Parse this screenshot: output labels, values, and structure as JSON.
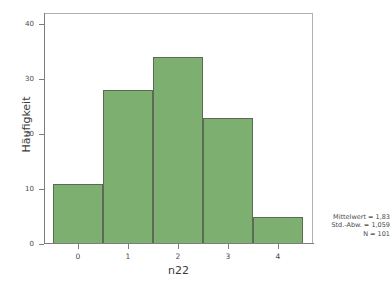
{
  "chart_data": {
    "type": "bar",
    "title": "",
    "subtitle": "",
    "xlabel": "n22",
    "ylabel": "Häufigkeit",
    "categories": [
      "0",
      "1",
      "2",
      "3",
      "4"
    ],
    "values": [
      11,
      28,
      34,
      23,
      5
    ],
    "series": [
      {
        "name": "Häufigkeit",
        "values": [
          11,
          28,
          34,
          23,
          5
        ]
      }
    ],
    "ylim": [
      0,
      42
    ],
    "yticks": [
      0,
      10,
      20,
      30,
      40
    ],
    "ytick_labels": [
      "0",
      "10",
      "20",
      "30",
      "40"
    ],
    "xticks": [
      0,
      1,
      2,
      3,
      4
    ],
    "xtick_labels": [
      "0",
      "1",
      "2",
      "3",
      "4"
    ],
    "grid": false,
    "legend": false,
    "bar_fill_color": "#7caf70",
    "bar_edge_color": "#5d6b56",
    "background_color": "#ffffff",
    "frame_color": "#b0b0b0",
    "annotations": [
      "Mittelwert = 1,83",
      "Std.-Abw. = 1,059",
      "N = 101"
    ]
  },
  "stats": {
    "mean_line": "Mittelwert = 1,83",
    "stddev_line": "Std.-Abw. = 1,059",
    "n_line": "N = 101"
  }
}
